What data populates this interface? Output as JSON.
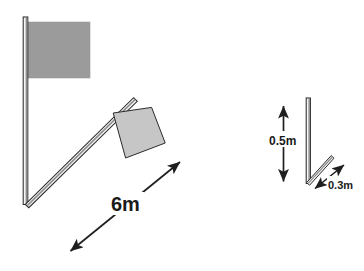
{
  "figure": {
    "background_color": "#ffffff",
    "stroke_color": "#2b2b2b",
    "flag_fill_large": "#9b9b9b",
    "flag_fill_small": "#c6c6c6",
    "pole_fill": "#f2f2f2",
    "pole_shade": "#8d8d8d"
  },
  "left_view": {
    "name": "flagpole-bending-view",
    "vertical_pole": {
      "label": "vertical-flagpole",
      "top_y": 17,
      "bottom_y": 204,
      "x": 25
    },
    "large_flag": {
      "label": "large-flag",
      "fill": "#9b9b9b"
    },
    "bent_pole": {
      "label": "bent-flagpole",
      "tip_x": 137,
      "tip_y": 101
    },
    "small_flag": {
      "label": "tilted-flag",
      "fill": "#c6c6c6"
    },
    "dimension": {
      "name": "length-dimension",
      "value": "6m",
      "arrow_style": "double-headed"
    }
  },
  "right_view": {
    "name": "deflection-detail-view",
    "vertical_pole": {
      "label": "detail-vertical-pole",
      "top_y": 98,
      "bottom_y": 183,
      "x": 308
    },
    "diagonal": {
      "label": "detail-deflected-pole"
    },
    "height_dimension": {
      "name": "height-dimension",
      "value": "0.5m",
      "arrow_style": "double-headed",
      "orientation": "vertical"
    },
    "offset_dimension": {
      "name": "offset-dimension",
      "value": "0.3m",
      "arrow_style": "double-headed",
      "orientation": "diagonal"
    }
  }
}
